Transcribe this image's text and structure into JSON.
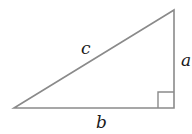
{
  "diagram": {
    "type": "right-triangle",
    "labels": {
      "hypotenuse": "c",
      "vertical_leg": "a",
      "horizontal_leg": "b"
    },
    "vertices": {
      "left": [
        14,
        108
      ],
      "top_right": [
        174,
        10
      ],
      "bottom_right": [
        174,
        108
      ]
    },
    "right_angle_marker": "bottom-right",
    "stroke_color": "#8a8a8a"
  }
}
